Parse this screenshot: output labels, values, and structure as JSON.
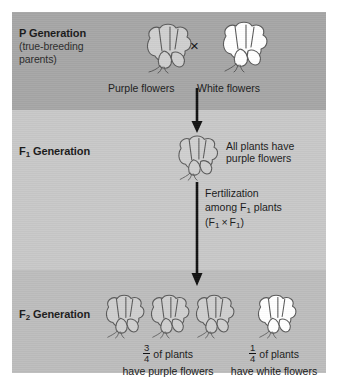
{
  "figure": {
    "cross_symbol": "×",
    "colors": {
      "band_p_background": "#a6a6a6",
      "band_f1_background": "#c8c8c8",
      "band_f2_background": "#bdbdbd",
      "purple_flower_fill": "#cfcfcf",
      "white_flower_fill": "#ffffff",
      "outline": "#4a4a4a",
      "arrow": "#111111",
      "text": "#1a1a1a"
    }
  },
  "generations": {
    "p": {
      "label": "P Generation",
      "sublabel": "(true-breeding parents)",
      "sublabel_line1": "(true-breeding",
      "sublabel_line2": "parents)",
      "parent_left": {
        "caption": "Purple flowers",
        "flower_type": "purple"
      },
      "parent_right": {
        "caption": "White flowers",
        "flower_type": "white"
      }
    },
    "f1": {
      "label": "F",
      "label_subscript": "1",
      "label_suffix": " Generation",
      "full_label": "F1 Generation",
      "offspring_caption_line1": "All plants have",
      "offspring_caption_line2": "purple flowers",
      "flower_type": "purple",
      "fertilization_note": {
        "line1": "Fertilization",
        "line2_prefix": "among F",
        "line2_subscript": "1",
        "line2_suffix": " plants",
        "line3_open": "(F",
        "line3_sub1": "1",
        "line3_times": "×",
        "line3_f2": "F",
        "line3_sub2": "1",
        "line3_close": ")"
      }
    },
    "f2": {
      "label": "F",
      "label_subscript": "2",
      "label_suffix": " Generation",
      "full_label": "F2 Generation",
      "purple_group": {
        "count": 3,
        "fraction_numerator": "3",
        "fraction_denominator": "4",
        "caption_line1_suffix": "of plants",
        "caption_line2": "have purple flowers",
        "flower_type": "purple"
      },
      "white_group": {
        "count": 1,
        "fraction_numerator": "1",
        "fraction_denominator": "4",
        "caption_line1_suffix": "of plants",
        "caption_line2": "have white flowers",
        "flower_type": "white"
      }
    }
  }
}
